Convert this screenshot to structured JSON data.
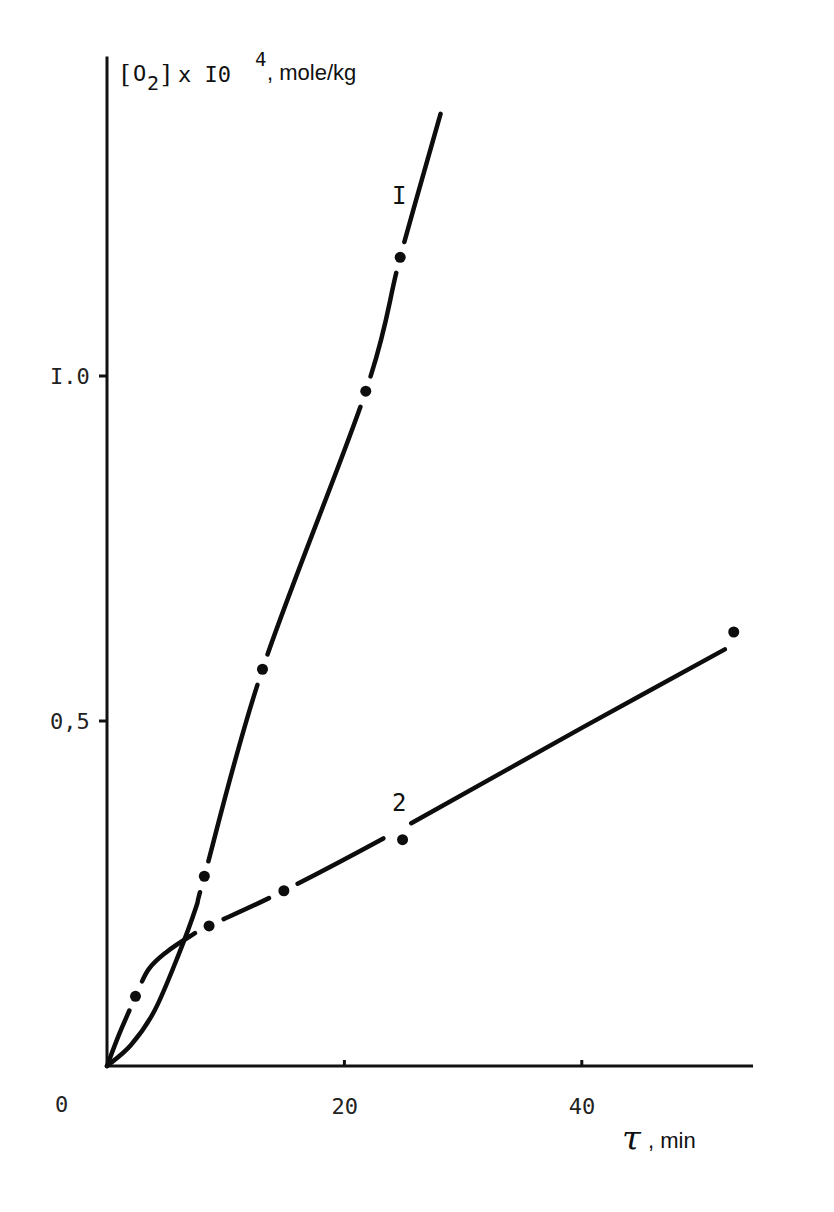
{
  "chart_data": {
    "type": "line",
    "title": "",
    "ylabel": {
      "species": "O",
      "subscript": "2",
      "multiplier": "x I0",
      "exponent": "4",
      "units": ", mole/kg",
      "full": "[O2] x 10^4, mole/kg"
    },
    "xlabel": {
      "symbol": "τ",
      "units": ", min",
      "full": "τ, min"
    },
    "origin_label": "0",
    "xlim": [
      0,
      54.3
    ],
    "ylim": [
      0,
      1.45
    ],
    "xticks": [
      {
        "value": 20,
        "label": "20"
      },
      {
        "value": 40,
        "label": "40"
      }
    ],
    "yticks": [
      {
        "value": 0.5,
        "label": "0,5"
      },
      {
        "value": 1.0,
        "label": "I.0"
      }
    ],
    "grid": false,
    "legend": "none (curves labeled inline)",
    "series": [
      {
        "name": "I",
        "label": "I",
        "points": [
          {
            "x": 8.2,
            "y": 0.275
          },
          {
            "x": 13.1,
            "y": 0.575
          },
          {
            "x": 21.8,
            "y": 0.978
          },
          {
            "x": 24.7,
            "y": 1.172
          }
        ],
        "fit_curve": [
          [
            0,
            0
          ],
          [
            2,
            0.03
          ],
          [
            4,
            0.08
          ],
          [
            6,
            0.16
          ],
          [
            7.5,
            0.23
          ],
          [
            8.2,
            0.275
          ],
          [
            13.1,
            0.575
          ],
          [
            21.8,
            0.978
          ],
          [
            24.7,
            1.172
          ],
          [
            28.1,
            1.38
          ]
        ]
      },
      {
        "name": "2",
        "label": "2",
        "points": [
          {
            "x": 2.4,
            "y": 0.101
          },
          {
            "x": 8.6,
            "y": 0.203
          },
          {
            "x": 14.9,
            "y": 0.254
          },
          {
            "x": 24.9,
            "y": 0.328
          },
          {
            "x": 52.8,
            "y": 0.629
          }
        ],
        "fit_curve": [
          [
            0,
            0
          ],
          [
            1,
            0.045
          ],
          [
            2,
            0.085
          ],
          [
            2.4,
            0.101
          ],
          [
            3.5,
            0.14
          ],
          [
            5,
            0.165
          ],
          [
            7,
            0.188
          ],
          [
            8.6,
            0.203
          ],
          [
            14.9,
            0.254
          ],
          [
            24.9,
            0.345
          ],
          [
            40,
            0.49
          ],
          [
            54.3,
            0.625
          ]
        ]
      }
    ]
  }
}
